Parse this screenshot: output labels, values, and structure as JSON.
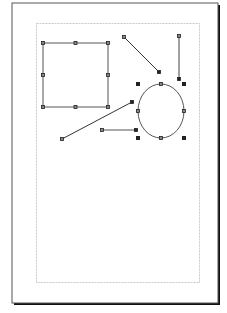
{
  "document": {
    "page": {
      "x": 12,
      "y": 3,
      "width": 206,
      "height": 300,
      "border_color": "#555555",
      "shadow_color": "#111111"
    },
    "margin_guide": {
      "x": 36,
      "y": 23,
      "width": 163,
      "height": 259,
      "color": "#c8c8c8"
    }
  },
  "shapes": [
    {
      "type": "rectangle",
      "name": "rectangle",
      "x": 43,
      "y": 43,
      "width": 65,
      "height": 64,
      "stroke": "#555555"
    },
    {
      "type": "line",
      "name": "line-diagonal-top",
      "x1": 124,
      "y1": 37,
      "x2": 159,
      "y2": 72,
      "stroke": "#333333"
    },
    {
      "type": "line",
      "name": "line-vertical",
      "x1": 179,
      "y1": 36,
      "x2": 179,
      "y2": 79,
      "stroke": "#444444"
    },
    {
      "type": "ellipse",
      "name": "ellipse",
      "cx": 161,
      "cy": 111,
      "rx": 23,
      "ry": 27,
      "stroke": "#555555"
    },
    {
      "type": "line",
      "name": "line-diagonal-long",
      "x1": 62,
      "y1": 139,
      "x2": 132,
      "y2": 102,
      "stroke": "#333333"
    },
    {
      "type": "line",
      "name": "line-horizontal",
      "x1": 102,
      "y1": 130,
      "x2": 136,
      "y2": 130,
      "stroke": "#555555"
    }
  ],
  "selection_handles": {
    "color": "#222222",
    "ellipse_bbox_handles": [
      [
        138,
        84
      ],
      [
        184,
        84
      ],
      [
        138,
        138
      ],
      [
        184,
        138
      ]
    ]
  }
}
